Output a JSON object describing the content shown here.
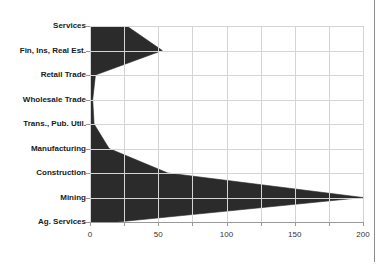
{
  "chart_data": {
    "type": "area",
    "orientation": "horizontal",
    "title": "",
    "xlabel": "",
    "ylabel": "",
    "categories": [
      "Services",
      "Fin, Ins, Real Est.",
      "Retail Trade",
      "Wholesale Trade",
      "Trans., Pub. Util.",
      "Manufacturing",
      "Construction",
      "Mining",
      "Ag. Services"
    ],
    "values": [
      27,
      53,
      4,
      2,
      3,
      14,
      57,
      200,
      20
    ],
    "xlim": [
      0,
      200
    ],
    "xticks": [
      0,
      25,
      50,
      75,
      100,
      125,
      150,
      175,
      200
    ],
    "xtick_labels": [
      "0",
      "",
      "50",
      "",
      "100",
      "",
      "150",
      "",
      "200"
    ],
    "grid": true,
    "legend": false,
    "series_color": "#2b2b2b",
    "grid_color": "#d4d4d4",
    "axis_color": "#9a9a9a",
    "background_color": "#ffffff"
  }
}
